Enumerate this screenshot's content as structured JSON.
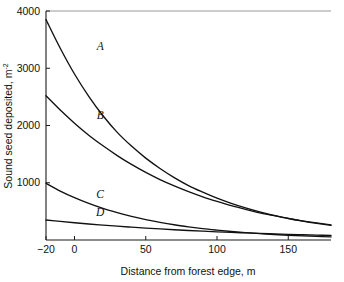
{
  "chart_data": {
    "type": "line",
    "title": "",
    "xlabel": "Distance from forest edge, m",
    "ylabel": "Sound seed deposited, m",
    "ylabel_superscript": "-2",
    "xlim": [
      -20,
      180
    ],
    "ylim": [
      0,
      4000
    ],
    "grid": false,
    "legend_position": "inline-curve-labels",
    "xticks": [
      -20,
      0,
      50,
      100,
      150
    ],
    "xticklabels": [
      "−20",
      "0",
      "50",
      "100",
      "150"
    ],
    "yticks": [
      1000,
      2000,
      3000,
      4000
    ],
    "yticklabels": [
      "1000",
      "2000",
      "3000",
      "4000"
    ],
    "x": [
      -20,
      -10,
      0,
      10,
      20,
      30,
      40,
      50,
      60,
      70,
      80,
      90,
      100,
      110,
      120,
      130,
      140,
      150,
      160,
      170,
      180
    ],
    "series": [
      {
        "name": "A",
        "label": "A",
        "label_x": 18,
        "label_y": 3320,
        "values": [
          3850,
          3350,
          2900,
          2510,
          2170,
          1880,
          1640,
          1430,
          1250,
          1090,
          950,
          835,
          730,
          640,
          560,
          490,
          430,
          375,
          330,
          290,
          255
        ]
      },
      {
        "name": "B",
        "label": "B",
        "label_x": 18,
        "label_y": 2120,
        "values": [
          2520,
          2270,
          2040,
          1830,
          1645,
          1475,
          1320,
          1180,
          1055,
          945,
          845,
          755,
          675,
          600,
          535,
          475,
          425,
          378,
          335,
          298,
          265
        ]
      },
      {
        "name": "C",
        "label": "C",
        "label_x": 18,
        "label_y": 735,
        "values": [
          990,
          855,
          740,
          640,
          552,
          478,
          412,
          356,
          308,
          266,
          230,
          198,
          172,
          148,
          128,
          111,
          96,
          83,
          72,
          62,
          54
        ]
      },
      {
        "name": "D",
        "label": "D",
        "label_x": 18,
        "label_y": 420,
        "values": [
          350,
          325,
          302,
          280,
          260,
          241,
          224,
          208,
          193,
          179,
          166,
          154,
          143,
          133,
          124,
          115,
          107,
          99,
          92,
          85,
          79
        ]
      }
    ]
  },
  "figure": {
    "background_color": "#ffffff",
    "line_color": "#111111",
    "axis_color": "#1a1a1a"
  }
}
